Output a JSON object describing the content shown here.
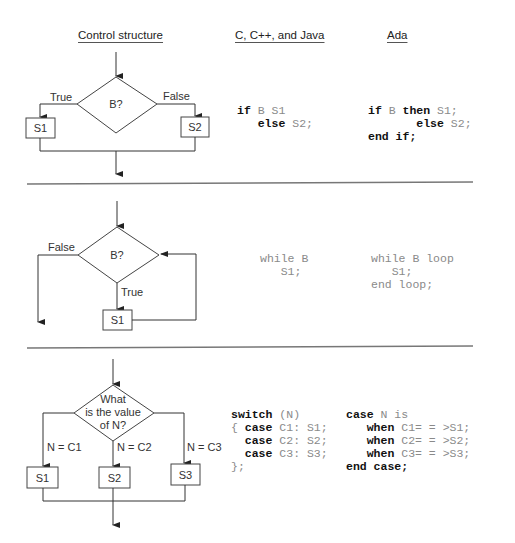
{
  "headers": {
    "control_structure": "Control structure",
    "c_family": "C, C++, and Java",
    "ada": "Ada"
  },
  "if_section": {
    "diagram": {
      "condition": "B?",
      "true_label": "True",
      "false_label": "False",
      "true_box": "S1",
      "false_box": "S2"
    },
    "c_code": {
      "line1_kw": "if",
      "line1_rest": " B S1",
      "line2_indent": "   ",
      "line2_kw": "else",
      "line2_rest": " S2;"
    },
    "ada_code": {
      "line1_kw1": "if",
      "line1_mid": " B ",
      "line1_kw2": "then",
      "line1_rest": " S1;",
      "line2_indent": "       ",
      "line2_kw": "else",
      "line2_rest": " S2;",
      "line3_kw": "end if;"
    }
  },
  "while_section": {
    "diagram": {
      "condition": "B?",
      "false_label": "False",
      "true_label": "True",
      "body_box": "S1"
    },
    "c_code": {
      "line1": "while B",
      "line2": "   S1;"
    },
    "ada_code": {
      "line1": "while B loop",
      "line2": "   S1;",
      "line3": "end loop;"
    }
  },
  "case_section": {
    "diagram": {
      "condition_line1": "What",
      "condition_line2": "is the value",
      "condition_line3": "of N?",
      "branch1_label": "N = C1",
      "branch2_label": "N = C2",
      "branch3_label": "N = C3",
      "box1": "S1",
      "box2": "S2",
      "box3": "S3"
    },
    "c_code": {
      "l1_kw": "switch",
      "l1_rest": " (N)",
      "l2_pre": "{ ",
      "l2_kw": "case",
      "l2_rest": " C1: S1;",
      "l3_pre": "  ",
      "l3_kw": "case",
      "l3_rest": " C2: S2;",
      "l4_pre": "  ",
      "l4_kw": "case",
      "l4_rest": " C3: S3;",
      "l5": "};"
    },
    "ada_code": {
      "l1_kw": "case",
      "l1_rest": " N is",
      "l2_pre": "   ",
      "l2_kw": "when",
      "l2_rest": " C1= = >S1;",
      "l3_pre": "   ",
      "l3_kw": "when",
      "l3_rest": " C2= = >S2;",
      "l4_pre": "   ",
      "l4_kw": "when",
      "l4_rest": " C3= = >S3;",
      "l5_kw": "end case;"
    }
  }
}
